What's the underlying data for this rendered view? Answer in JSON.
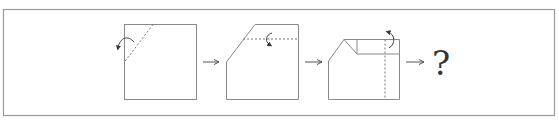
{
  "puzzle": {
    "type": "paper-folding sequence",
    "steps": [
      {
        "id": 1,
        "description": "Square with dashed diagonal fold line near top-left corner; curved arrow indicates folding the corner backward"
      },
      {
        "id": 2,
        "description": "Square with top-left corner cut off; dashed horizontal fold line near top; curved arrow indicates folding the top strip down"
      },
      {
        "id": 3,
        "description": "Shape with folded top strip; dashed vertical fold line near right edge; curved arrow indicates folding the right strip back"
      }
    ],
    "arrows": [
      "→",
      "→",
      "→"
    ],
    "answer_placeholder": "?"
  },
  "colors": {
    "line": "#8a8a8a",
    "frame": "#9a9a9a",
    "arrow": "#555555",
    "text": "#333333",
    "background": "#ffffff"
  }
}
